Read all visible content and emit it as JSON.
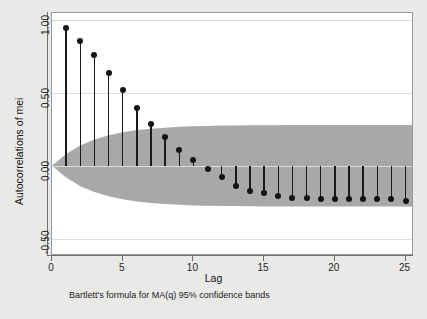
{
  "chart_data": {
    "type": "scatter",
    "title": "",
    "xlabel": "Lag",
    "ylabel": "Autocorrelations of mei",
    "xlim": [
      0,
      25.6
    ],
    "ylim": [
      -0.62,
      1.05
    ],
    "xticks": [
      0,
      5,
      10,
      15,
      20,
      25
    ],
    "xtick_labels": [
      "0",
      "5",
      "10",
      "15",
      "20",
      "25"
    ],
    "yticks": [
      1.0,
      0.5,
      0.0,
      -0.5
    ],
    "ytick_labels": [
      "1.00",
      "0.50",
      "0.00",
      "-0.50"
    ],
    "grid": true,
    "grid_axis": "y",
    "note": "Bartlett's formula for MA(q) 95% confidence bands",
    "marker_color": "#141414",
    "stem_color": "#1a1a1a",
    "band_color": "#a8a8a8",
    "plot_background": "#ffffff",
    "figure_background": "#e9e9e7",
    "x": [
      1,
      2,
      3,
      4,
      5,
      6,
      7,
      8,
      9,
      10,
      11,
      12,
      13,
      14,
      15,
      16,
      17,
      18,
      19,
      20,
      21,
      22,
      23,
      24,
      25
    ],
    "values": [
      0.95,
      0.86,
      0.76,
      0.64,
      0.52,
      0.4,
      0.29,
      0.2,
      0.11,
      0.04,
      -0.02,
      -0.08,
      -0.14,
      -0.17,
      -0.19,
      -0.21,
      -0.22,
      -0.22,
      -0.23,
      -0.23,
      -0.23,
      -0.23,
      -0.23,
      -0.23,
      -0.24
    ],
    "confidence_band_upper": [
      0.08,
      0.14,
      0.18,
      0.21,
      0.23,
      0.245,
      0.255,
      0.262,
      0.268,
      0.272,
      0.274,
      0.276,
      0.277,
      0.278,
      0.279,
      0.279,
      0.28,
      0.28,
      0.28,
      0.28,
      0.28,
      0.28,
      0.28,
      0.28,
      0.28
    ],
    "confidence_band_lower": [
      -0.08,
      -0.14,
      -0.18,
      -0.21,
      -0.23,
      -0.245,
      -0.255,
      -0.262,
      -0.268,
      -0.272,
      -0.274,
      -0.276,
      -0.277,
      -0.278,
      -0.279,
      -0.279,
      -0.28,
      -0.28,
      -0.28,
      -0.28,
      -0.28,
      -0.28,
      -0.28,
      -0.28,
      -0.28
    ]
  },
  "axis": {
    "y_title": "Autocorrelations of mei",
    "x_title": "Lag"
  },
  "footer": {
    "note": "Bartlett's formula for MA(q) 95% confidence bands"
  }
}
